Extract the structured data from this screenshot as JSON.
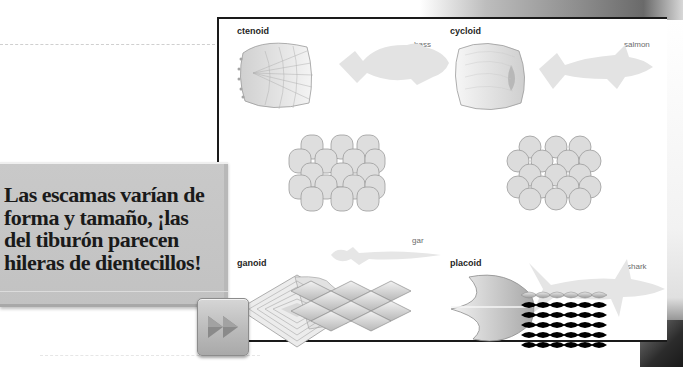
{
  "caption": {
    "text": "Las escamas varían de forma y tamaño, ¡las del tiburón parecen hileras de dientecillos!",
    "lines": [
      "Las escamas varían de",
      "forma y tamaño, ¡las",
      "del tiburón parecen",
      "hileras de dientecillos!"
    ]
  },
  "next_button": {
    "icon": "fast-forward-icon"
  },
  "figure": {
    "quadrants": [
      {
        "scale_type": "ctenoid",
        "fish": "bass"
      },
      {
        "scale_type": "cycloid",
        "fish": "salmon"
      },
      {
        "scale_type": "ganoid",
        "fish": "gar"
      },
      {
        "scale_type": "placoid",
        "fish": "shark"
      }
    ]
  },
  "colors": {
    "panel": "#c4c4c4",
    "border": "#1a1a1a",
    "fish_silhouette": "#e3e3e3",
    "scale_fill": "#d9d9d9"
  }
}
